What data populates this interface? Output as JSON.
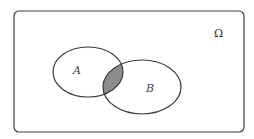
{
  "diagram": {
    "type": "venn",
    "universe_label": "Ω",
    "sets": [
      {
        "label": "A"
      },
      {
        "label": "B"
      }
    ],
    "shaded_region": "A ∩ B",
    "colors": {
      "stroke": "#3a3a3a",
      "shade": "#8c8c8c",
      "background": "#ffffff"
    }
  }
}
